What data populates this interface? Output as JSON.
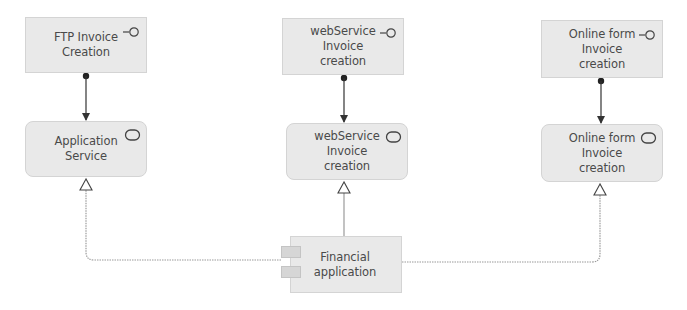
{
  "diagram": {
    "type": "ArchiMate application layer view",
    "colors": {
      "node_fill": "#e9e9e9",
      "node_border": "#d4d4d4",
      "text": "#4a4a4a",
      "connector": "#333333",
      "realization_line": "#9a9a9a"
    },
    "nodes": [
      {
        "id": "ftp_interface",
        "kind": "application-interface",
        "label": "FTP Invoice\nCreation",
        "icon": "interface-icon"
      },
      {
        "id": "webservice_interface",
        "kind": "application-interface",
        "label": "webService\nInvoice\ncreation",
        "icon": "interface-icon"
      },
      {
        "id": "onlineform_interface",
        "kind": "application-interface",
        "label": "Online form\nInvoice\ncreation",
        "icon": "interface-icon"
      },
      {
        "id": "application_service",
        "kind": "application-service",
        "label": "Application\nService",
        "icon": "service-icon"
      },
      {
        "id": "webservice_service",
        "kind": "application-service",
        "label": "webService\nInvoice\ncreation",
        "icon": "service-icon"
      },
      {
        "id": "onlineform_service",
        "kind": "application-service",
        "label": "Online form\nInvoice\ncreation",
        "icon": "service-icon"
      },
      {
        "id": "financial_application",
        "kind": "application-component",
        "label": "Financial\napplication",
        "icon": "component-icon"
      }
    ],
    "edges": [
      {
        "from": "ftp_interface",
        "to": "application_service",
        "type": "assignment"
      },
      {
        "from": "webservice_interface",
        "to": "webservice_service",
        "type": "assignment"
      },
      {
        "from": "onlineform_interface",
        "to": "onlineform_service",
        "type": "assignment"
      },
      {
        "from": "financial_application",
        "to": "application_service",
        "type": "realization"
      },
      {
        "from": "financial_application",
        "to": "webservice_service",
        "type": "realization"
      },
      {
        "from": "financial_application",
        "to": "onlineform_service",
        "type": "realization"
      }
    ]
  }
}
